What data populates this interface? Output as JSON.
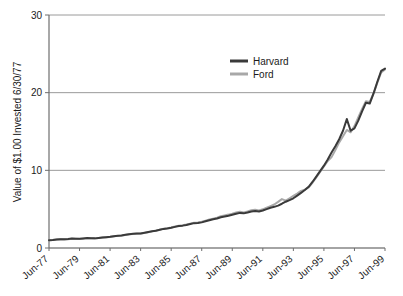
{
  "chart_data": {
    "type": "line",
    "title": "",
    "xlabel": "",
    "ylabel": "Value of $1.00 Invested 6/30/77",
    "ylim": [
      0,
      30
    ],
    "yticks": [
      0,
      10,
      20,
      30
    ],
    "ytick_labels": [
      "0",
      "10",
      "20",
      "30"
    ],
    "grid": "horizontal",
    "legend_position": "top-center-right",
    "xtick_labels": [
      "Jun-77",
      "Jun-79",
      "Jun-81",
      "Jun-83",
      "Jun-85",
      "Jun-87",
      "Jun-89",
      "Jun-91",
      "Jun-93",
      "Jun-95",
      "Jun-97",
      "Jun-99"
    ],
    "x_start": 1977.5,
    "x_end": 2000.5,
    "x_step_years": 0.25,
    "series": [
      {
        "name": "Harvard",
        "color": "#3a3a3a",
        "values": [
          1.0,
          1.04,
          1.1,
          1.14,
          1.12,
          1.16,
          1.22,
          1.2,
          1.18,
          1.23,
          1.28,
          1.26,
          1.24,
          1.3,
          1.36,
          1.4,
          1.44,
          1.52,
          1.58,
          1.62,
          1.7,
          1.78,
          1.82,
          1.86,
          1.88,
          1.96,
          2.05,
          2.15,
          2.22,
          2.34,
          2.46,
          2.52,
          2.6,
          2.72,
          2.84,
          2.88,
          2.96,
          3.08,
          3.2,
          3.22,
          3.3,
          3.44,
          3.58,
          3.7,
          3.8,
          3.96,
          4.06,
          4.16,
          4.28,
          4.4,
          4.52,
          4.46,
          4.56,
          4.7,
          4.76,
          4.7,
          4.82,
          5.0,
          5.18,
          5.3,
          5.46,
          5.7,
          5.96,
          6.16,
          6.4,
          6.74,
          7.1,
          7.46,
          7.88,
          8.5,
          9.2,
          9.9,
          10.6,
          11.4,
          12.3,
          13.1,
          14.0,
          15.1,
          16.6,
          15.1,
          15.4,
          16.4,
          17.6,
          18.7,
          18.6,
          19.9,
          21.4,
          22.8,
          23.1
        ]
      },
      {
        "name": "Ford",
        "color": "#a8a8a8",
        "values": [
          1.0,
          1.03,
          1.08,
          1.12,
          1.1,
          1.14,
          1.2,
          1.18,
          1.16,
          1.21,
          1.26,
          1.25,
          1.22,
          1.28,
          1.34,
          1.38,
          1.43,
          1.5,
          1.56,
          1.6,
          1.68,
          1.76,
          1.8,
          1.84,
          1.87,
          1.94,
          2.04,
          2.14,
          2.24,
          2.36,
          2.48,
          2.56,
          2.64,
          2.76,
          2.88,
          2.92,
          3.02,
          3.14,
          3.26,
          3.28,
          3.38,
          3.52,
          3.66,
          3.78,
          3.9,
          4.08,
          4.2,
          4.3,
          4.42,
          4.56,
          4.66,
          4.58,
          4.7,
          4.86,
          4.92,
          4.84,
          4.98,
          5.2,
          5.4,
          5.6,
          5.94,
          6.3,
          6.1,
          6.4,
          6.7,
          7.0,
          7.36,
          7.52,
          7.8,
          8.4,
          9.1,
          9.8,
          10.5,
          11.2,
          11.7,
          12.6,
          13.6,
          14.4,
          15.2,
          14.9,
          15.7,
          16.8,
          17.9,
          18.9,
          18.8,
          19.9,
          21.3,
          22.6,
          23.0
        ]
      }
    ]
  },
  "legend": {
    "items": [
      {
        "label": "Harvard",
        "color": "#3a3a3a"
      },
      {
        "label": "Ford",
        "color": "#a8a8a8"
      }
    ]
  },
  "axes": {
    "y_title": "Value of $1.00 Invested 6/30/77",
    "y_ticks": [
      "30",
      "20",
      "10",
      "0"
    ],
    "x_ticks": [
      "Jun-77",
      "Jun-79",
      "Jun-81",
      "Jun-83",
      "Jun-85",
      "Jun-87",
      "Jun-89",
      "Jun-91",
      "Jun-93",
      "Jun-95",
      "Jun-97",
      "Jun-99"
    ]
  }
}
